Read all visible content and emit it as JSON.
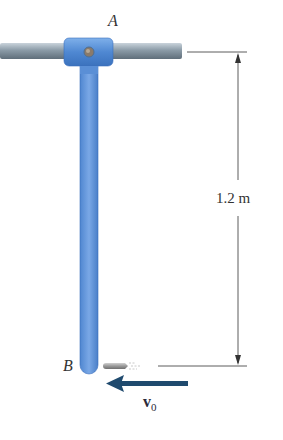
{
  "diagram": {
    "type": "mechanics-figure",
    "labels": {
      "point_a": "A",
      "point_b": "B",
      "dimension": "1.2 m",
      "velocity_symbol": "v",
      "velocity_subscript": "0"
    },
    "colors": {
      "rod_blue": "#5b8fd6",
      "rod_blue_dark": "#3a6fbd",
      "shaft_gray": "#8a9aa6",
      "arrow_navy": "#1f4a6e",
      "dimension_line": "#333333",
      "pin": "#8a7a6a"
    }
  }
}
